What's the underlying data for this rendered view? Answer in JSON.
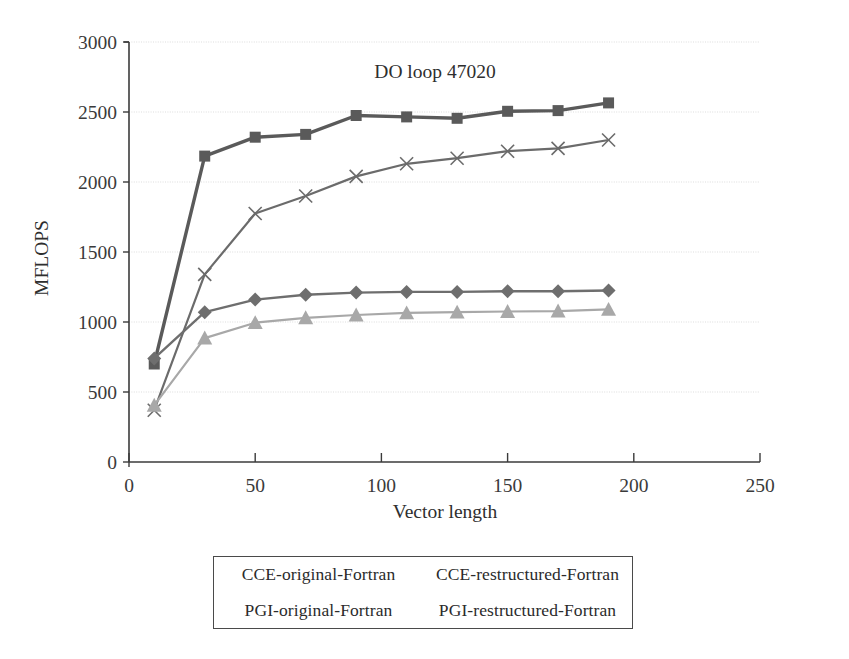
{
  "chart_data": {
    "type": "line",
    "title": "DO loop 47020",
    "xlabel": "Vector length",
    "ylabel": "MFLOPS",
    "xlim": [
      0,
      250
    ],
    "ylim": [
      0,
      3000
    ],
    "xticks": [
      0,
      50,
      100,
      150,
      200,
      250
    ],
    "yticks": [
      0,
      500,
      1000,
      1500,
      2000,
      2500,
      3000
    ],
    "grid": "horizontal",
    "legend_position": "below-plot",
    "x": [
      10,
      30,
      50,
      70,
      90,
      110,
      130,
      150,
      170,
      190
    ],
    "series": [
      {
        "name": "CCE-original-Fortran",
        "marker": "square",
        "color": "#5a5a5a",
        "values": [
          700,
          2185,
          2320,
          2340,
          2475,
          2465,
          2455,
          2505,
          2510,
          2565
        ]
      },
      {
        "name": "CCE-restructured-Fortran",
        "marker": "x",
        "color": "#6b6b6b",
        "values": [
          370,
          1340,
          1775,
          1900,
          2040,
          2130,
          2170,
          2220,
          2240,
          2300
        ]
      },
      {
        "name": "PGI-original-Fortran",
        "marker": "diamond",
        "color": "#6e6e6e",
        "values": [
          740,
          1070,
          1160,
          1195,
          1210,
          1215,
          1215,
          1220,
          1220,
          1225
        ]
      },
      {
        "name": "PGI-restructured-Fortran",
        "marker": "triangle",
        "color": "#a8a8a8",
        "values": [
          405,
          885,
          995,
          1030,
          1050,
          1065,
          1070,
          1075,
          1078,
          1090
        ]
      }
    ]
  },
  "legend": {
    "entries": [
      "CCE-original-Fortran",
      "CCE-restructured-Fortran",
      "PGI-original-Fortran",
      "PGI-restructured-Fortran"
    ]
  },
  "colors": {
    "axis": "#3b3b3b",
    "grid": "#d9d9d9",
    "text": "#2e2e2e",
    "background": "#ffffff"
  }
}
